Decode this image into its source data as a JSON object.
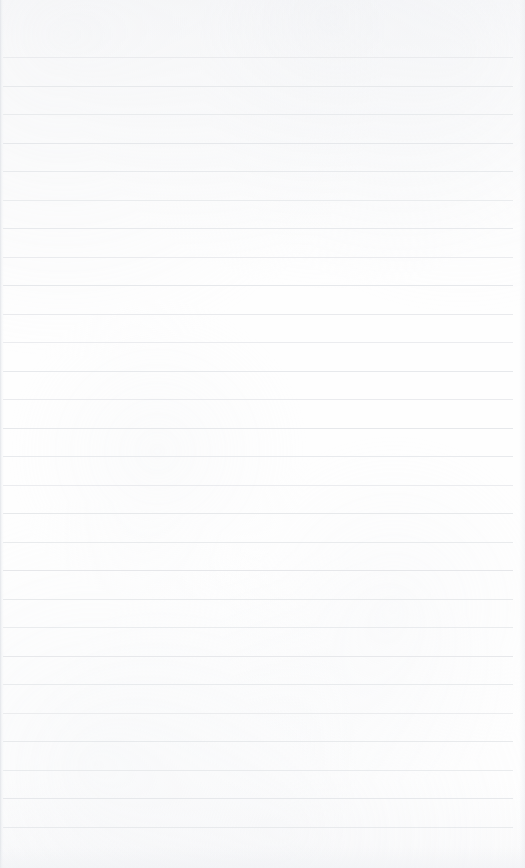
{
  "page": {
    "kind": "blank-ruled-notebook-page",
    "width": 525,
    "height": 868,
    "has_text_content": false,
    "has_handwriting": false,
    "has_header": false,
    "has_footer": false,
    "has_margin_rule": false,
    "background_color": "#fdfdfd",
    "rule_color": "#e4e6e9"
  },
  "ruling": {
    "line_count": 28,
    "first_line_y": 57,
    "line_spacing": 28.5,
    "line_thickness": 1,
    "line_start_x": 3,
    "line_end_x": 513,
    "top_margin_height": 57,
    "bottom_margin_height": 41,
    "lines_y": [
      57,
      85.5,
      114,
      142.5,
      171,
      199.5,
      228,
      256.5,
      285,
      313.5,
      342,
      370.5,
      399,
      427.5,
      456,
      484.5,
      513,
      541.5,
      570,
      598.5,
      627,
      655.5,
      684,
      712.5,
      741,
      769.5,
      798,
      826.5
    ]
  },
  "edges": {
    "left_shadow": true,
    "right_shadow": true,
    "bottom_shadow": true
  }
}
